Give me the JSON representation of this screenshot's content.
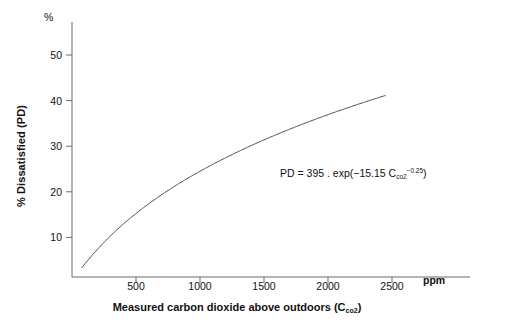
{
  "chart_data": {
    "type": "line",
    "title": "",
    "xlabel": "Measured carbon dioxide above outdoors (C",
    "xlabel_sub": "co2",
    "xlabel_tail": ")",
    "ylabel": "% Dissatisfied (PD)",
    "y_unit_label": "%",
    "x_unit_label": "ppm",
    "xlim": [
      0,
      2800
    ],
    "ylim": [
      0,
      57
    ],
    "xticks": [
      500,
      1000,
      1500,
      2000,
      2500
    ],
    "yticks": [
      10,
      20,
      30,
      40,
      50
    ],
    "grid": false,
    "legend": "none",
    "annotation": {
      "text_head": "PD = 395 . exp(−15.15 C",
      "text_sub": "co2",
      "text_sup": "−0.25",
      "text_tail": ")"
    },
    "series": [
      {
        "name": "PD vs CO2",
        "formula": "PD = 395 * exp(-15.15 * C^-0.25)",
        "x": [
          75,
          100,
          150,
          200,
          250,
          300,
          350,
          400,
          450,
          500,
          600,
          700,
          800,
          900,
          1000,
          1100,
          1200,
          1300,
          1400,
          1500,
          1600,
          1700,
          1800,
          1900,
          2000,
          2100,
          2200,
          2300,
          2400,
          2450
        ],
        "y": [
          1.2,
          2.3,
          4.8,
          7.2,
          9.4,
          11.5,
          13.4,
          15.2,
          16.8,
          18.3,
          21.0,
          23.4,
          25.6,
          27.5,
          29.3,
          30.9,
          32.4,
          33.8,
          35.1,
          36.3,
          37.4,
          38.5,
          39.5,
          40.4,
          41.3,
          42.1,
          42.9,
          43.7,
          44.4,
          44.8
        ]
      }
    ],
    "curve_endpoints": {
      "start": {
        "x": 75,
        "y": 1.2
      },
      "end": {
        "x": 2450,
        "y": 50.0
      }
    }
  },
  "axis_ticks": {
    "y": [
      "50",
      "40",
      "30",
      "20",
      "10"
    ],
    "x": [
      "500",
      "1000",
      "1500",
      "2000",
      "2500"
    ]
  }
}
